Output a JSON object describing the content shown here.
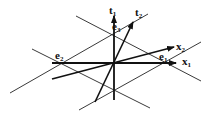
{
  "diagram": {
    "labels": {
      "t1": "t",
      "t1_sub": "1",
      "t2": "t",
      "t2_sub": "2",
      "x1": "x",
      "x1_sub": "1",
      "x2": "x",
      "x2_sub": "2",
      "e1": "e",
      "e1_sub": "1",
      "e2": "e",
      "e2_sub": "2",
      "e3": "e",
      "e3_sub": "3"
    },
    "colors": {
      "stroke": "#111111",
      "background": "#ffffff"
    }
  }
}
